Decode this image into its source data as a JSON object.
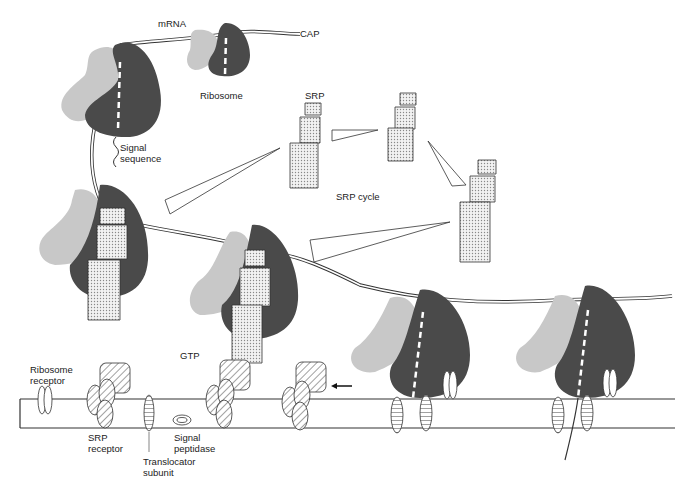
{
  "diagram": {
    "labels": {
      "mrna": "mRNA",
      "cap": "CAP",
      "ribosome": "Ribosome",
      "signal_sequence_1": "Signal",
      "signal_sequence_2": "sequence",
      "srp": "SRP",
      "srp_cycle": "SRP cycle",
      "gtp": "GTP",
      "ribosome_receptor_1": "Ribosome",
      "ribosome_receptor_2": "receptor",
      "srp_receptor_1": "SRP",
      "srp_receptor_2": "receptor",
      "translocator_1": "Translocator",
      "translocator_2": "subunit",
      "signal_peptidase_1": "Signal",
      "signal_peptidase_2": "peptidase"
    },
    "colors": {
      "large_subunit": "#4a4a4a",
      "small_subunit": "#c8c8c8",
      "srp_fill": "#e6e6e6",
      "membrane": "#333333",
      "background": "#ffffff"
    }
  }
}
